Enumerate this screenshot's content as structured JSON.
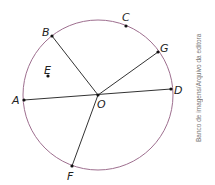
{
  "figure": {
    "center": {
      "label": "O",
      "x": 98,
      "y": 95
    },
    "radius": 75,
    "circle_color": "#9e6f8f",
    "line_color": "#333333",
    "points": [
      {
        "label": "A",
        "x": 24,
        "y": 100
      },
      {
        "label": "B",
        "x": 52,
        "y": 36
      },
      {
        "label": "C",
        "x": 126,
        "y": 26
      },
      {
        "label": "D",
        "x": 171,
        "y": 89
      },
      {
        "label": "E",
        "x": 48,
        "y": 76
      },
      {
        "label": "F",
        "x": 72,
        "y": 166
      },
      {
        "label": "G",
        "x": 158,
        "y": 52
      }
    ],
    "segments": [
      "AD",
      "OB",
      "OG",
      "OF"
    ]
  },
  "labels": {
    "A": "A",
    "B": "B",
    "C": "C",
    "D": "D",
    "E": "E",
    "F": "F",
    "G": "G",
    "O": "O"
  },
  "credit": "Banco de imagens/Arquivo da editora"
}
